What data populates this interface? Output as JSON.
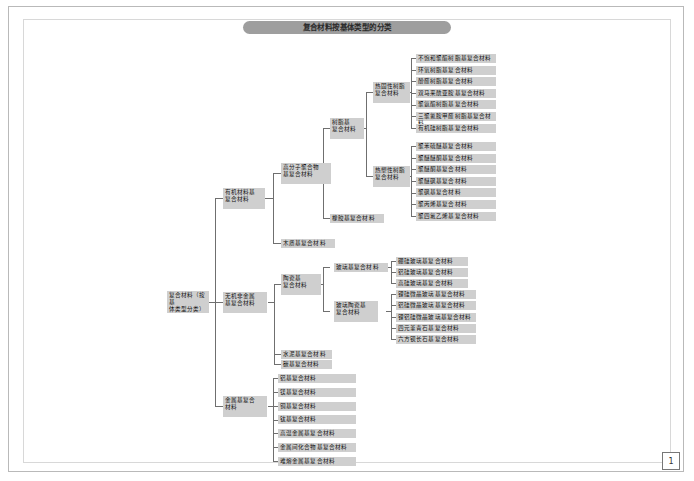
{
  "page": {
    "title": "复合材料按基体类型的分类",
    "page_number": "1"
  },
  "nodes": {
    "root": "复合材料（按基\n体类型分类）",
    "l2": {
      "organic": "有机材料基\n复合材料",
      "inorganic": "无机非金属\n基复合材料",
      "metal": "金属基复合\n材料"
    },
    "l3": {
      "polymer": "高分子聚合物\n基复合材料",
      "wood": "木质基复合材料",
      "ceramic": "陶瓷基\n复合材料",
      "cement": "水泥基复合材料",
      "carbon": "碳基复合材料"
    },
    "l4": {
      "resin": "树脂基\n复合材料",
      "rubber": "橡胶基复合材料",
      "glass": "玻璃基复合材料",
      "glass_ceramic": "玻璃陶瓷基\n复合材料"
    },
    "l5": {
      "thermoset": "热固性树脂\n复合材料",
      "thermoplastic": "热塑性树脂\n复合材料"
    }
  },
  "leaves": {
    "thermoset": [
      "不饱和聚酯树脂基复合材料",
      "环氧树脂基复合材料",
      "酚醛树脂基复合材料",
      "双马来酰亚胺基复合材料",
      "聚氨酯树脂基复合材料",
      "三聚氰胺甲醛树脂基复合材料",
      "有机硅树脂基复合材料"
    ],
    "thermoplastic": [
      "聚苯硫醚基复合材料",
      "聚醚醚酮基复合材料",
      "聚醚酮基复合材料",
      "聚醚砜基复合材料",
      "聚砜基复合材料",
      "聚丙烯基复合材料",
      "聚四氟乙烯基复合材料"
    ],
    "glass": [
      "硼硅玻璃基复合材料",
      "铝硅玻璃基复合材料",
      "高硅玻璃基复合材料"
    ],
    "glass_ceramic": [
      "锂硅微晶玻璃基复合材料",
      "铝硅微晶玻璃基复合材料",
      "锂铝硅微晶玻璃基复合材料",
      "四元堇青石基复合材料",
      "六方钡长石基复合材料"
    ],
    "metal": [
      "铝基复合材料",
      "镁基复合材料",
      "铜基复合材料",
      "钛基复合材料",
      "高温金属基复合材料",
      "金属间化合物基复合材料",
      "难熔金属基复合材料"
    ]
  },
  "colors": {
    "node_fill": "#cfcfcf",
    "title_fill": "#9e9e9e",
    "line": "#6f6f6f",
    "frame": "#b9b9b9"
  }
}
